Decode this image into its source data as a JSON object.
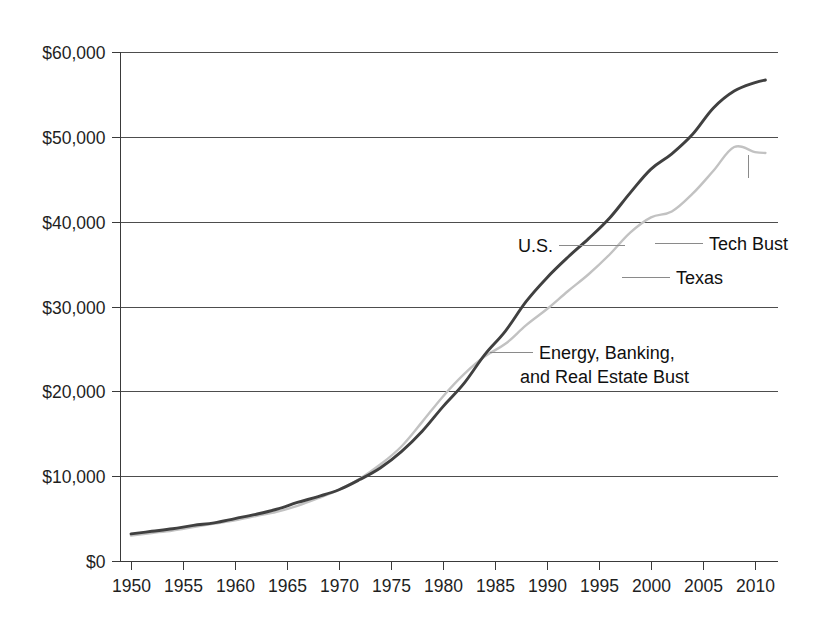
{
  "chart_data": {
    "type": "line",
    "title": "",
    "subtitle": "",
    "xlabel": "",
    "ylabel": "",
    "xlim": [
      1950,
      2012
    ],
    "ylim": [
      0,
      60000
    ],
    "grid": true,
    "legend_position": "inline-annotations",
    "y_ticks": [
      "$0",
      "$10,000",
      "$20,000",
      "$30,000",
      "$40,000",
      "$50,000",
      "$60,000"
    ],
    "y_tick_values": [
      0,
      10000,
      20000,
      30000,
      40000,
      50000,
      60000
    ],
    "x_ticks": [
      "1950",
      "1955",
      "1960",
      "1965",
      "1970",
      "1975",
      "1980",
      "1985",
      "1990",
      "1995",
      "2000",
      "2005",
      "2010"
    ],
    "x_tick_values": [
      1950,
      1955,
      1960,
      1965,
      1970,
      1975,
      1980,
      1985,
      1990,
      1995,
      2000,
      2005,
      2010
    ],
    "x": [
      1950,
      1952,
      1954,
      1956,
      1958,
      1960,
      1962,
      1964,
      1966,
      1968,
      1970,
      1972,
      1974,
      1976,
      1978,
      1980,
      1982,
      1984,
      1986,
      1988,
      1990,
      1992,
      1994,
      1996,
      1998,
      2000,
      2002,
      2004,
      2006,
      2008,
      2010,
      2011
    ],
    "series": [
      {
        "name": "U.S.",
        "color": "#404040",
        "values": [
          3200,
          3500,
          3800,
          4200,
          4500,
          5000,
          5500,
          6100,
          6900,
          7600,
          8400,
          9600,
          11000,
          12900,
          15300,
          18200,
          20900,
          24300,
          27100,
          30600,
          33400,
          35800,
          38000,
          40400,
          43400,
          46200,
          48000,
          50300,
          53400,
          55400,
          56400,
          56700
        ]
      },
      {
        "name": "Texas",
        "color": "#c2c2c2",
        "values": [
          3000,
          3300,
          3600,
          4000,
          4400,
          4800,
          5300,
          5800,
          6500,
          7400,
          8400,
          9700,
          11400,
          13500,
          16400,
          19400,
          22000,
          24100,
          25600,
          27800,
          29700,
          31800,
          33800,
          36100,
          38700,
          40500,
          41200,
          43300,
          46000,
          48800,
          48200,
          48100
        ]
      }
    ],
    "annotations": [
      {
        "name": "us",
        "label": "U.S.",
        "target_x": 1990,
        "target_y": 33400
      },
      {
        "name": "texas",
        "label": "Texas",
        "target_x": 1999,
        "target_y": 34700
      },
      {
        "name": "tech-bust",
        "label": "Tech Bust",
        "target_x": 2002,
        "target_y": 41200
      },
      {
        "name": "great-recession",
        "label": "Great Recession",
        "target_x": 2008,
        "target_y": 48800
      },
      {
        "name": "energy-banking",
        "label_line1": "Energy, Banking,",
        "label_line2": "and Real Estate Bust",
        "target_x": 1987,
        "target_y": 26200
      }
    ]
  }
}
